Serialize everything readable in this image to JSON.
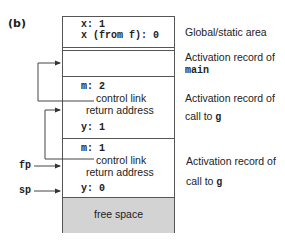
{
  "panel": {
    "label": "(b)"
  },
  "stack": {
    "global": {
      "lines": [
        "x: 1",
        "x (from f): 0"
      ],
      "side_label": "Global/static area"
    },
    "main_record": {
      "side_label_line1": "Activation record of",
      "side_label_line2": "main"
    },
    "call_g_1": {
      "m": "m: 2",
      "control_link": "control link",
      "return_address": "return address",
      "y": "y: 1",
      "side_label_line1": "Activation record of",
      "side_label_line2_prefix": "call to ",
      "side_label_line2_code": "g"
    },
    "call_g_2": {
      "m": "m: 1",
      "control_link": "control link",
      "return_address": "return address",
      "y": "y: 0",
      "side_label_line1": "Activation record of",
      "side_label_line2_prefix": "call to ",
      "side_label_line2_code": "g"
    },
    "free_space": {
      "label": "free space",
      "color": "#d3d3d3"
    }
  },
  "pointers": {
    "fp": "fp",
    "sp": "sp"
  }
}
